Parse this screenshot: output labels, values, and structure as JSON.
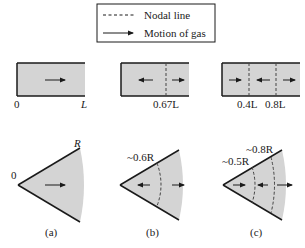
{
  "legend": {
    "items": [
      {
        "symbol": "dashed-line",
        "label": "Nodal line"
      },
      {
        "symbol": "arrow",
        "label": "Motion of gas"
      }
    ]
  },
  "colors": {
    "fill": "#d4d4d4",
    "stroke": "#1a1a1a",
    "nodal": "#444444"
  },
  "ducts": [
    {
      "id": "a",
      "left_label": "0",
      "right_label": "L",
      "nodes": [],
      "node_labels": []
    },
    {
      "id": "b",
      "nodes": [
        0.67
      ],
      "node_labels": [
        "0.67L"
      ]
    },
    {
      "id": "c",
      "nodes": [
        0.4,
        0.8
      ],
      "node_labels": [
        "0.4L",
        "0.8L"
      ]
    }
  ],
  "sectors": [
    {
      "id": "a",
      "apex_label": "0",
      "radius_label": "R",
      "caption": "(a)",
      "nodes": [],
      "node_labels": []
    },
    {
      "id": "b",
      "caption": "(b)",
      "nodes": [
        0.6
      ],
      "node_labels": [
        "~0.6R"
      ]
    },
    {
      "id": "c",
      "caption": "(c)",
      "nodes": [
        0.5,
        0.8
      ],
      "node_labels": [
        "~0.5R",
        "~0.8R"
      ]
    }
  ]
}
